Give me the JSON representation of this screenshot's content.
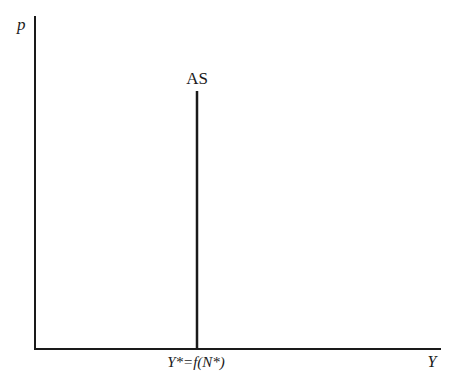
{
  "diagram": {
    "y_axis": {
      "label": "p"
    },
    "x_axis": {
      "label": "Y"
    },
    "curve": {
      "label": "AS",
      "type": "vertical"
    },
    "equilibrium_tick": {
      "label": "Y*=f(N*)"
    },
    "colors": {
      "line": "#1a1a1a",
      "background": "#ffffff"
    }
  }
}
